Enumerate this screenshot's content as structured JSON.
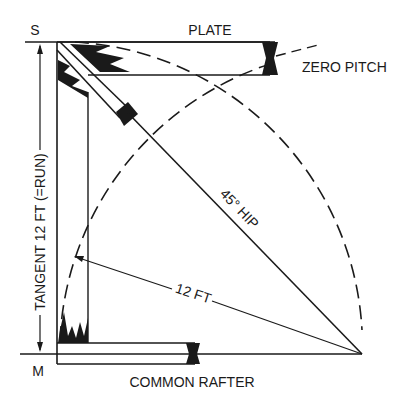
{
  "diagram": {
    "labels": {
      "plate": "PLATE",
      "zero_pitch": "ZERO PITCH",
      "s_point": "S",
      "m_point": "M",
      "tangent": "TANGENT 12 FT (=RUN)",
      "hip": "45° HIP",
      "radius": "12 FT",
      "common_rafter": "COMMON RAFTER"
    },
    "colors": {
      "ink": "#1a1a1a",
      "background": "#ffffff"
    }
  }
}
